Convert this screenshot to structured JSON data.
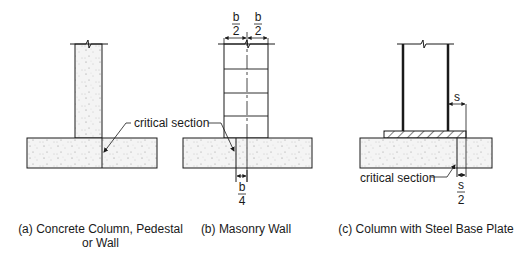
{
  "figure": {
    "panels": [
      {
        "id": "a",
        "caption_line1": "(a) Concrete Column, Pedestal",
        "caption_line2": "or Wall",
        "callout": "critical section"
      },
      {
        "id": "b",
        "caption_line1": "(b) Masonry Wall",
        "callout": "critical section",
        "dim_top_left_num": "b",
        "dim_top_left_den": "2",
        "dim_top_right_num": "b",
        "dim_top_right_den": "2",
        "dim_bottom_num": "b",
        "dim_bottom_den": "4"
      },
      {
        "id": "c",
        "caption_line1": "(c) Column with Steel Base Plate",
        "callout": "critical section",
        "dim_side": "s",
        "dim_bottom_num": "s",
        "dim_bottom_den": "2"
      }
    ],
    "colors": {
      "line": "#1a1a1a",
      "concrete_fill": "#f2f2f2",
      "stipple": "#9a9a9a"
    }
  }
}
